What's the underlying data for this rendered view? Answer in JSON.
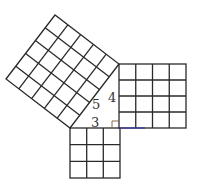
{
  "diagram": {
    "labels": {
      "hypotenuse": "5",
      "vertical_leg": "4",
      "horizontal_leg": "3"
    },
    "squares": [
      {
        "name": "square-on-hypotenuse",
        "grid": 5
      },
      {
        "name": "square-on-vertical-leg",
        "grid": 4
      },
      {
        "name": "square-on-horizontal-leg",
        "grid": 3
      }
    ],
    "colors": {
      "line": "#2a2a2a",
      "base_leg": "#3a3aa0",
      "right_angle_mark": "#8a6a4a"
    }
  }
}
